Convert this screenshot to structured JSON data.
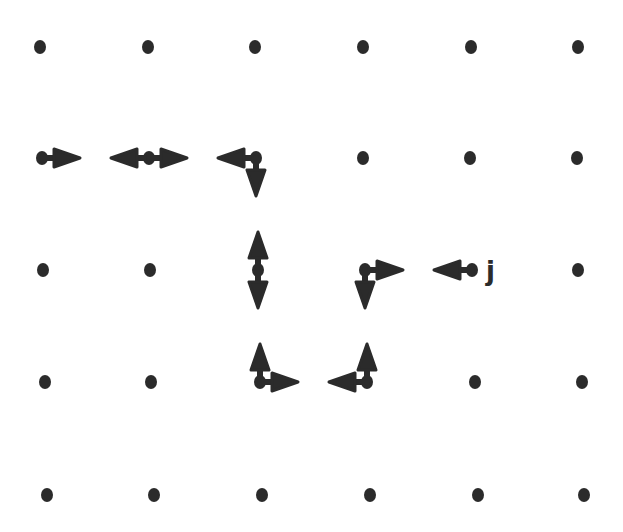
{
  "diagram": {
    "title": "",
    "grid": {
      "columns": 6,
      "rows": 5
    },
    "colors": {
      "ink": "#2b2b2b",
      "background": "#ffffff"
    },
    "nodes_with_arrows": [
      {
        "col": 0,
        "row": 1,
        "arrows": [
          "right"
        ]
      },
      {
        "col": 1,
        "row": 1,
        "arrows": [
          "left",
          "right"
        ]
      },
      {
        "col": 2,
        "row": 1,
        "arrows": [
          "left",
          "down"
        ]
      },
      {
        "col": 2,
        "row": 2,
        "arrows": [
          "up",
          "down"
        ]
      },
      {
        "col": 3,
        "row": 2,
        "arrows": [
          "right",
          "down"
        ]
      },
      {
        "col": 4,
        "row": 2,
        "arrows": [
          "left"
        ],
        "label": "j"
      },
      {
        "col": 2,
        "row": 3,
        "arrows": [
          "up",
          "right"
        ]
      },
      {
        "col": 3,
        "row": 3,
        "arrows": [
          "left",
          "up"
        ]
      }
    ],
    "labels": [
      {
        "col": 4,
        "row": 2,
        "text": "j"
      }
    ]
  }
}
